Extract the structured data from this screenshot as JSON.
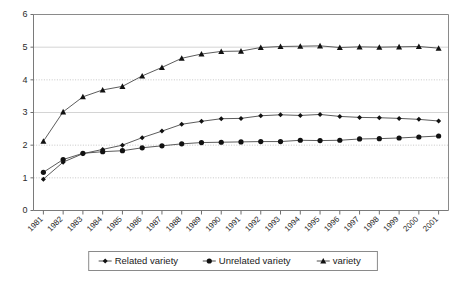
{
  "chart_data": {
    "type": "line",
    "title": "",
    "xlabel": "",
    "ylabel": "",
    "categories": [
      "1981",
      "1982",
      "1983",
      "1984",
      "1985",
      "1986",
      "1987",
      "1988",
      "1989",
      "1990",
      "1991",
      "1992",
      "1993",
      "1994",
      "1995",
      "1996",
      "1997",
      "1998",
      "1999",
      "2000",
      "2001"
    ],
    "series": [
      {
        "name": "Related variety",
        "marker": "diamond",
        "values": [
          0.96,
          1.48,
          1.74,
          1.87,
          2.0,
          2.23,
          2.43,
          2.64,
          2.73,
          2.81,
          2.82,
          2.9,
          2.93,
          2.91,
          2.94,
          2.88,
          2.85,
          2.84,
          2.82,
          2.79,
          2.74
        ]
      },
      {
        "name": "Unrelated variety",
        "marker": "circle",
        "values": [
          1.17,
          1.56,
          1.75,
          1.8,
          1.83,
          1.92,
          1.98,
          2.04,
          2.08,
          2.09,
          2.1,
          2.11,
          2.11,
          2.15,
          2.14,
          2.15,
          2.19,
          2.2,
          2.22,
          2.25,
          2.28
        ]
      },
      {
        "name": "variety",
        "marker": "triangle",
        "values": [
          2.12,
          3.02,
          3.48,
          3.69,
          3.8,
          4.12,
          4.38,
          4.66,
          4.79,
          4.87,
          4.88,
          4.99,
          5.02,
          5.03,
          5.04,
          4.99,
          5.01,
          5.0,
          5.01,
          5.02,
          4.97
        ]
      }
    ],
    "ylim": [
      0,
      6
    ],
    "yticks": [
      0,
      1,
      2,
      3,
      4,
      5,
      6
    ],
    "ytick_labels": [
      "0",
      "1",
      "2",
      "3",
      "4",
      "5",
      "6"
    ],
    "grid": true,
    "grid_axis": "y",
    "legend_position": "bottom"
  },
  "legend": {
    "entries": [
      {
        "label": "Related variety",
        "marker": "diamond"
      },
      {
        "label": "Unrelated variety",
        "marker": "circle"
      },
      {
        "label": "variety",
        "marker": "triangle"
      }
    ]
  },
  "colors": {
    "line": "#4a4a4a",
    "marker": "#111111",
    "grid": "#b9b9b9",
    "axis": "#7a7a7a",
    "background": "#ffffff",
    "text": "#1a1a1a"
  }
}
